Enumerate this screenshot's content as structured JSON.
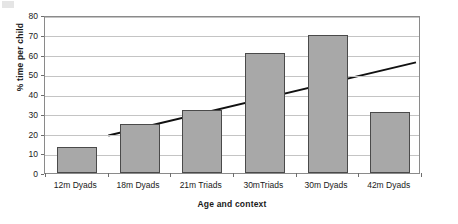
{
  "chart_data": {
    "type": "bar",
    "title": "",
    "xlabel": "Age and context",
    "ylabel": "% time per child",
    "categories": [
      "12m Dyads",
      "18m Dyads",
      "21m Triads",
      "30mTriads",
      "30m Dyads",
      "42m Dyads"
    ],
    "values": [
      13,
      25,
      32,
      61,
      70,
      31
    ],
    "ylim": [
      0,
      80
    ],
    "ytick_labels": [
      "0",
      "10",
      "20",
      "30",
      "40",
      "50",
      "60",
      "70",
      "80"
    ],
    "ytick_values": [
      0,
      10,
      20,
      30,
      40,
      50,
      60,
      70,
      80
    ],
    "grid": "horizontal",
    "legend": "none",
    "series": [
      {
        "name": "% time per child",
        "type": "bar",
        "values": [
          13,
          25,
          32,
          61,
          70,
          31
        ],
        "color": "#a8a8a8",
        "edge_color": "#4a4a4a"
      },
      {
        "name": "linear trend",
        "type": "line",
        "color": "#111111",
        "start_value": 20,
        "end_value": 57
      }
    ]
  },
  "axes": {
    "y_title": "% time per child",
    "x_title": "Age and context"
  }
}
